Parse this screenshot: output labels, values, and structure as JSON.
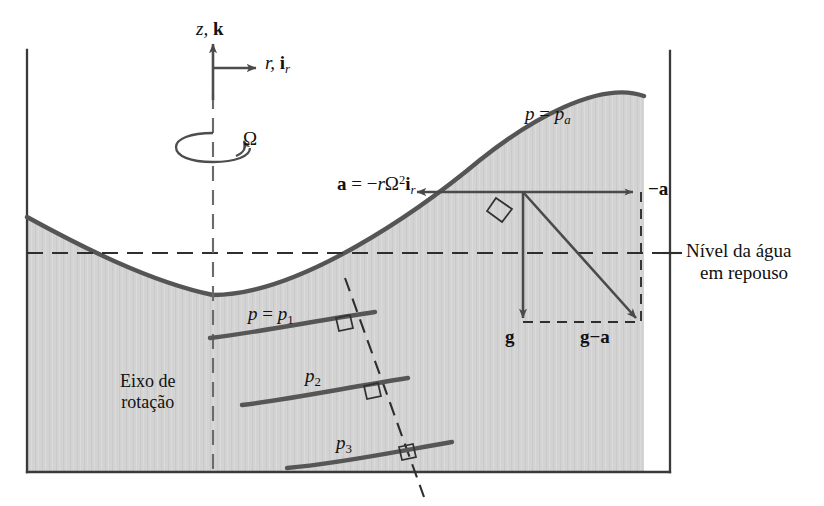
{
  "figure": {
    "language": "pt-BR",
    "colors": {
      "fluid_fill": "#d2d2d2",
      "surface_line": "#4d4d4d",
      "container_line": "#3a3a3a",
      "vector_line": "#4a4a4a",
      "dashed_line": "#2e2e2e",
      "text": "#111111",
      "background": "#ffffff"
    },
    "axes": {
      "vertical_label_plain": "z,",
      "vertical_label_vector": "k",
      "horizontal_label_plain": "r,",
      "horizontal_label_vector": "i",
      "horizontal_label_vector_sub": "r"
    },
    "rotation": {
      "symbol": "Ω"
    },
    "labels": {
      "free_surface_pressure_lhs": "p",
      "free_surface_pressure_eq": "=",
      "free_surface_pressure_rhs": "p",
      "free_surface_pressure_sub": "a",
      "acceleration_lhs": "a",
      "acceleration_eq": "=",
      "acceleration_minus": "−",
      "acceleration_r": "r",
      "acceleration_omega": "Ω",
      "acceleration_exp": "2",
      "acceleration_unit": "i",
      "acceleration_unit_sub": "r",
      "minus_a": "−a",
      "gravity": "g",
      "gravity_minus_accel_g": "g",
      "gravity_minus_accel_op": "−",
      "gravity_minus_accel_a": "a",
      "water_level_line1": "Nível da água",
      "water_level_line2": "em repouso",
      "axis_of_rotation_line1": "Eixo de",
      "axis_of_rotation_line2": "rotação",
      "isobar1_lhs": "p",
      "isobar1_eq": "=",
      "isobar1_rhs": "p",
      "isobar1_sub": "1",
      "isobar2_rhs": "p",
      "isobar2_sub": "2",
      "isobar3_rhs": "p",
      "isobar3_sub": "3"
    },
    "geometry": {
      "container_left_x": 27,
      "container_right_x": 670,
      "container_top_y": 50,
      "container_bottom_y": 472,
      "rest_level_y": 253,
      "axis_x": 213,
      "surface_vertex_x": 213,
      "surface_vertex_y": 295,
      "vector_origin_x": 523,
      "vector_origin_y": 192,
      "vector_g_tip_y": 318,
      "vector_minus_a_tip_x": 633
    }
  }
}
